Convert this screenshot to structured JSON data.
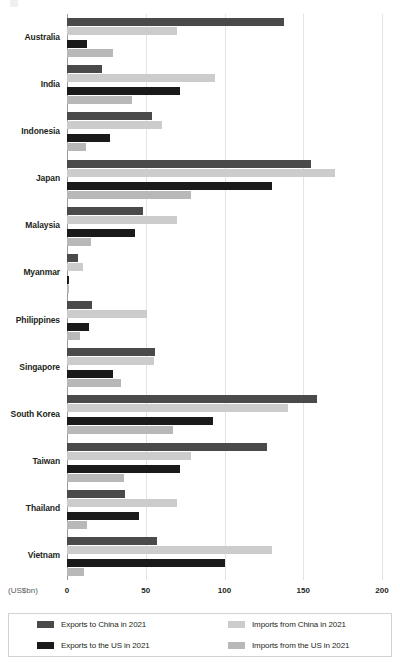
{
  "chart_data": {
    "type": "bar",
    "orientation": "horizontal",
    "title": "",
    "subtitle": "",
    "xlabel": "(US$bn)",
    "ylabel": "",
    "xlim": [
      0,
      200
    ],
    "xticks": [
      0,
      50,
      100,
      150,
      200
    ],
    "xtick_labels": [
      "0",
      "50",
      "100",
      "150",
      "200"
    ],
    "grid": "vertical",
    "legend_position": "bottom",
    "categories": [
      "Australia",
      "India",
      "Indonesia",
      "Japan",
      "Malaysia",
      "Myanmar",
      "Philippines",
      "Singapore",
      "South Korea",
      "Taiwan",
      "Thailand",
      "Vietnam"
    ],
    "series": [
      {
        "name": "Exports to China in 2021",
        "key": "exports_china",
        "color": "#4a4a4a",
        "values": [
          138,
          22,
          54,
          155,
          48,
          7,
          16,
          56,
          159,
          127,
          37,
          57
        ]
      },
      {
        "name": "Imports from China in 2021",
        "key": "imports_china",
        "color": "#cccccc",
        "values": [
          70,
          94,
          60,
          170,
          70,
          10,
          51,
          55,
          140,
          79,
          70,
          130
        ]
      },
      {
        "name": "Exports to the US in 2021",
        "key": "exports_us",
        "color": "#1a1a1a",
        "values": [
          13,
          72,
          27,
          130,
          43,
          1,
          14,
          29,
          93,
          72,
          46,
          100
        ]
      },
      {
        "name": "Imports from the US in 2021",
        "key": "imports_us",
        "color": "#b8b8b8",
        "values": [
          29,
          41,
          12,
          79,
          15,
          1,
          8,
          34,
          67,
          36,
          13,
          11
        ]
      }
    ]
  },
  "axis": {
    "unit_label": "(US$bn)"
  },
  "legend": {
    "items": [
      {
        "label": "Exports to China in 2021",
        "color": "#4a4a4a"
      },
      {
        "label": "Imports from China in 2021",
        "color": "#cccccc"
      },
      {
        "label": "Exports to the US in 2021",
        "color": "#1a1a1a"
      },
      {
        "label": "Imports from the US in 2021",
        "color": "#b8b8b8"
      }
    ]
  }
}
